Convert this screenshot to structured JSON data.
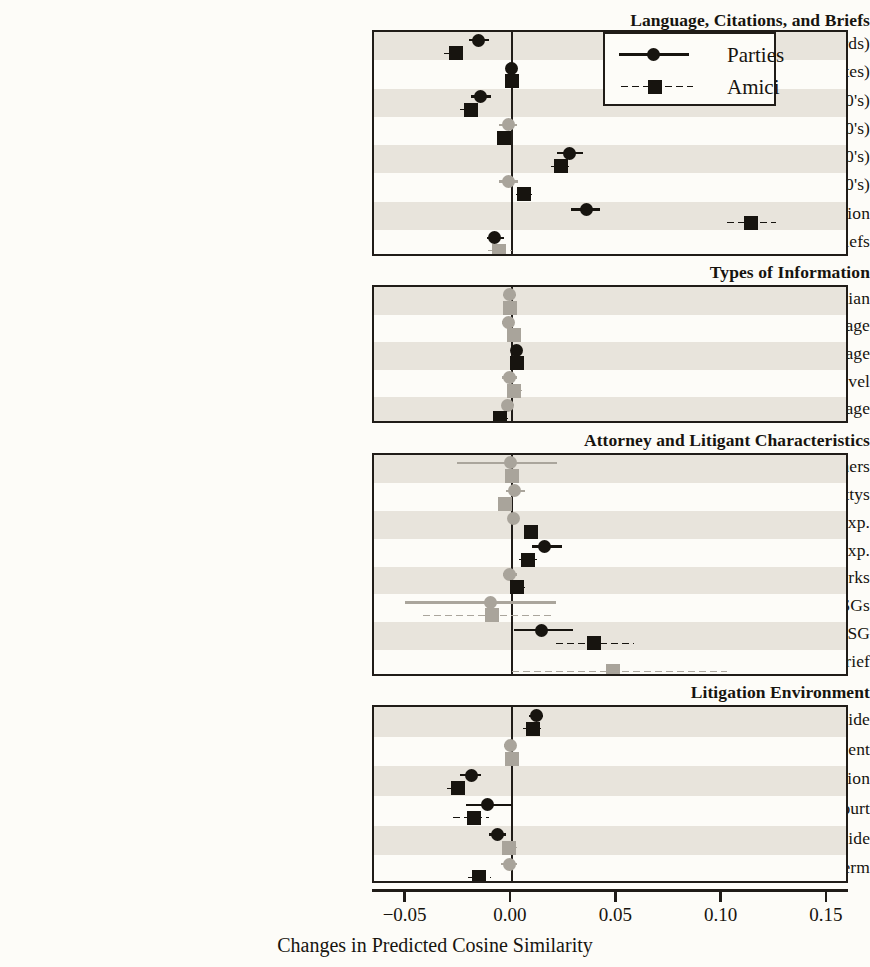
{
  "chart_data": {
    "type": "scatter",
    "title": "",
    "xlabel": "Changes in Predicted Cosine Similarity",
    "ylabel": "",
    "xlim": [
      -0.0655,
      0.1605
    ],
    "xticks": [
      -0.05,
      0.0,
      0.05,
      0.1,
      0.15
    ],
    "xticklabels": [
      "−0.05",
      "0.00",
      "0.05",
      "0.10",
      "0.15"
    ],
    "grid": false,
    "zero_reference_line": 0.0,
    "legend": {
      "position": "top-right-inside-panel-1",
      "entries": [
        {
          "name": "Parties",
          "marker": "circle",
          "line": "solid",
          "color": "#17140f"
        },
        {
          "name": "Amici",
          "marker": "square",
          "line": "dotted",
          "color": "#17140f"
        }
      ]
    },
    "series": [
      "Parties",
      "Amici"
    ],
    "significance_colors": {
      "significant": "#17140f",
      "not_significant": "#a9a49b"
    },
    "panels": [
      {
        "group": "Language, Citations, and Briefs",
        "rows": [
          {
            "label": "Overall Novelty (Words)",
            "parties": {
              "est": -0.0158,
              "lo": -0.0205,
              "hi": -0.0108,
              "sig": true
            },
            "amici": {
              "est": -0.0268,
              "lo": -0.033,
              "hi": -0.0228,
              "sig": true
            }
          },
          {
            "label": "Overall Novelty (Cites)",
            "parties": {
              "est": -0.0003,
              "lo": -0.0019,
              "hi": 0.0012,
              "sig": true
            },
            "amici": {
              "est": -0.0002,
              "lo": -0.0016,
              "hi": 0.0013,
              "sig": true
            }
          },
          {
            "label": "Unique Words (1000's)",
            "parties": {
              "est": -0.0148,
              "lo": -0.0196,
              "hi": -0.0098,
              "sig": true
            },
            "amici": {
              "est": -0.0196,
              "lo": -0.0255,
              "hi": -0.014,
              "sig": true
            }
          },
          {
            "label": "Unique Cites (100's)",
            "parties": {
              "est": -0.0018,
              "lo": -0.0062,
              "hi": 0.0024,
              "sig": false
            },
            "amici": {
              "est": -0.004,
              "lo": -0.0072,
              "hi": -0.001,
              "sig": true
            }
          },
          {
            "label": "Shared Words (1000's)",
            "parties": {
              "est": 0.0275,
              "lo": 0.0215,
              "hi": 0.0335,
              "sig": true
            },
            "amici": {
              "est": 0.0235,
              "lo": 0.0178,
              "hi": 0.0282,
              "sig": true
            }
          },
          {
            "label": "Shared Cites (100's)",
            "parties": {
              "est": -0.0015,
              "lo": -0.006,
              "hi": 0.0028,
              "sig": false
            },
            "amici": {
              "est": 0.0055,
              "lo": 0.0012,
              "hi": 0.0095,
              "sig": true
            }
          },
          {
            "label": "Similarity to Lower Court Opinion",
            "parties": {
              "est": 0.0352,
              "lo": 0.0282,
              "hi": 0.0418,
              "sig": true
            },
            "amici": {
              "est": 0.1135,
              "lo": 0.101,
              "hi": 0.1255,
              "sig": true
            }
          },
          {
            "label": "# of Briefs",
            "parties": {
              "est": -0.0082,
              "lo": -0.012,
              "hi": -0.004,
              "sig": true
            },
            "amici": {
              "est": -0.006,
              "lo": -0.0125,
              "hi": 0.0002,
              "sig": false
            }
          }
        ]
      },
      {
        "group": "Types of Information",
        "rows": [
          {
            "label": "Citations to Current Median",
            "parties": {
              "est": -0.0012,
              "lo": -0.0042,
              "hi": 0.0018,
              "sig": false
            },
            "amici": {
              "est": -0.001,
              "lo": -0.004,
              "hi": 0.002,
              "sig": false
            }
          },
          {
            "label": "Technical Language",
            "parties": {
              "est": -0.0018,
              "lo": -0.0046,
              "hi": 0.001,
              "sig": false
            },
            "amici": {
              "est": 0.0008,
              "lo": -0.0022,
              "hi": 0.0038,
              "sig": false
            }
          },
          {
            "label": "Future Language",
            "parties": {
              "est": 0.002,
              "lo": -0.0005,
              "hi": 0.0048,
              "sig": true
            },
            "amici": {
              "est": 0.0022,
              "lo": -0.0014,
              "hi": 0.0058,
              "sig": true
            }
          },
          {
            "label": "Grade Level",
            "parties": {
              "est": -0.0012,
              "lo": -0.0048,
              "hi": 0.0022,
              "sig": false
            },
            "amici": {
              "est": 0.0012,
              "lo": -0.0022,
              "hi": 0.0046,
              "sig": false
            }
          },
          {
            "label": "Emotional Language",
            "parties": {
              "est": -0.002,
              "lo": -0.0048,
              "hi": 0.0008,
              "sig": false
            },
            "amici": {
              "est": -0.0058,
              "lo": -0.0098,
              "hi": -0.0018,
              "sig": true
            }
          }
        ]
      },
      {
        "group": "Attorney and Litigant Characteristics",
        "rows": [
          {
            "label": "Log # of Cosigners",
            "parties": {
              "est": -0.0005,
              "lo": -0.026,
              "hi": 0.0215,
              "sig": false
            },
            "amici": {
              "est": -0.0002,
              "lo": -0.003,
              "hi": 0.0022,
              "sig": false
            }
          },
          {
            "label": "Log # of Attys",
            "parties": {
              "est": 0.001,
              "lo": -0.0028,
              "hi": 0.006,
              "sig": false
            },
            "amici": {
              "est": -0.0032,
              "lo": -0.0068,
              "hi": 0.0002,
              "sig": false
            }
          },
          {
            "label": "Log Max. Filer Exp.",
            "parties": {
              "est": 0.0008,
              "lo": -0.0018,
              "hi": 0.0034,
              "sig": false
            },
            "amici": {
              "est": 0.009,
              "lo": 0.005,
              "hi": 0.0126,
              "sig": true
            }
          },
          {
            "label": "Log Max. Attorney Exp.",
            "parties": {
              "est": 0.0155,
              "lo": 0.0095,
              "hi": 0.0238,
              "sig": true
            },
            "amici": {
              "est": 0.0078,
              "lo": 0.0022,
              "hi": 0.013,
              "sig": true
            }
          },
          {
            "label": "# of Former Clerks",
            "parties": {
              "est": -0.001,
              "lo": -0.0042,
              "hi": 0.0022,
              "sig": false
            },
            "amici": {
              "est": 0.0025,
              "lo": -0.0012,
              "hi": 0.0062,
              "sig": true
            }
          },
          {
            "label": "# of Former SGs",
            "parties": {
              "est": -0.01,
              "lo": -0.051,
              "hi": 0.021,
              "sig": false
            },
            "amici": {
              "est": -0.0095,
              "lo": -0.043,
              "hi": 0.0185,
              "sig": false
            }
          },
          {
            "label": "Current SG",
            "parties": {
              "est": 0.0142,
              "lo": 0.0008,
              "hi": 0.029,
              "sig": true
            },
            "amici": {
              "est": 0.039,
              "lo": 0.0198,
              "hi": 0.058,
              "sig": true
            }
          },
          {
            "label": "Court Invited Brief",
            "parties": {
              "est": null,
              "lo": null,
              "hi": null,
              "sig": false
            },
            "amici": {
              "est": 0.048,
              "lo": -0.0008,
              "hi": 0.102,
              "sig": false
            }
          }
        ]
      },
      {
        "group": "Litigation Environment",
        "rows": [
          {
            "label": "Petitioner's Side",
            "parties": {
              "est": 0.0115,
              "lo": 0.0082,
              "hi": 0.0148,
              "sig": true
            },
            "amici": {
              "est": 0.0098,
              "lo": 0.0042,
              "hi": 0.014,
              "sig": true
            }
          },
          {
            "label": "Ideological Alignment",
            "parties": {
              "est": -0.0005,
              "lo": -0.0038,
              "hi": 0.002,
              "sig": false
            },
            "amici": {
              "est": -0.0002,
              "lo": -0.004,
              "hi": 0.0025,
              "sig": false
            }
          },
          {
            "label": "Log Word Count LC Opinion",
            "parties": {
              "est": -0.019,
              "lo": -0.0248,
              "hi": -0.0145,
              "sig": true
            },
            "amici": {
              "est": -0.0258,
              "lo": -0.0318,
              "hi": -0.0205,
              "sig": true
            }
          },
          {
            "label": "Amicus Activity in Lower Court",
            "parties": {
              "est": -0.0118,
              "lo": -0.022,
              "hi": -0.0002,
              "sig": true
            },
            "amici": {
              "est": -0.0182,
              "lo": -0.029,
              "hi": -0.011,
              "sig": true
            }
          },
          {
            "label": "# of Oral Arg. Questions to Side",
            "parties": {
              "est": -0.0068,
              "lo": -0.011,
              "hi": -0.003,
              "sig": true
            },
            "amici": {
              "est": -0.0012,
              "lo": -0.0042,
              "hi": 0.0022,
              "sig": false
            }
          },
          {
            "label": "Term",
            "parties": {
              "est": -0.001,
              "lo": -0.0052,
              "hi": 0.0025,
              "sig": false
            },
            "amici": {
              "est": -0.0155,
              "lo": -0.0218,
              "hi": -0.0098,
              "sig": true
            }
          }
        ]
      }
    ]
  }
}
